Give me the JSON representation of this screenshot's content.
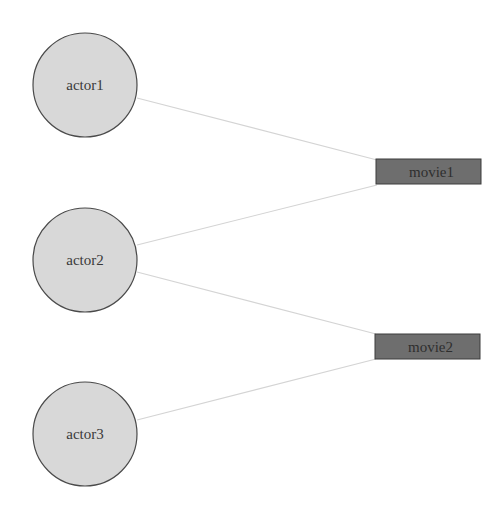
{
  "diagram": {
    "type": "bipartite-graph",
    "colors": {
      "actor_fill": "#d8d8d8",
      "actor_stroke": "#4a4a4a",
      "movie_fill": "#6e6e6e",
      "movie_stroke": "#3c3c3c",
      "edge": "#d4d4d4",
      "background": "#ffffff"
    },
    "actors": [
      {
        "id": "actor1",
        "label": "actor1",
        "cx": 85,
        "cy": 85,
        "r": 52
      },
      {
        "id": "actor2",
        "label": "actor2",
        "cx": 85,
        "cy": 260,
        "r": 52
      },
      {
        "id": "actor3",
        "label": "actor3",
        "cx": 85,
        "cy": 434,
        "r": 52
      }
    ],
    "movies": [
      {
        "id": "movie1",
        "label": "movie1",
        "x": 376,
        "y": 159,
        "w": 105,
        "h": 25
      },
      {
        "id": "movie2",
        "label": "movie2",
        "x": 375,
        "y": 334,
        "w": 105,
        "h": 25
      }
    ],
    "edges": [
      {
        "from": "actor1",
        "to": "movie1",
        "x1": 137,
        "y1": 98,
        "x2": 377,
        "y2": 160
      },
      {
        "from": "actor2",
        "to": "movie1",
        "x1": 137,
        "y1": 245,
        "x2": 377,
        "y2": 185
      },
      {
        "from": "actor2",
        "to": "movie2",
        "x1": 137,
        "y1": 272,
        "x2": 376,
        "y2": 334
      },
      {
        "from": "actor3",
        "to": "movie2",
        "x1": 137,
        "y1": 420,
        "x2": 376,
        "y2": 359
      }
    ]
  }
}
